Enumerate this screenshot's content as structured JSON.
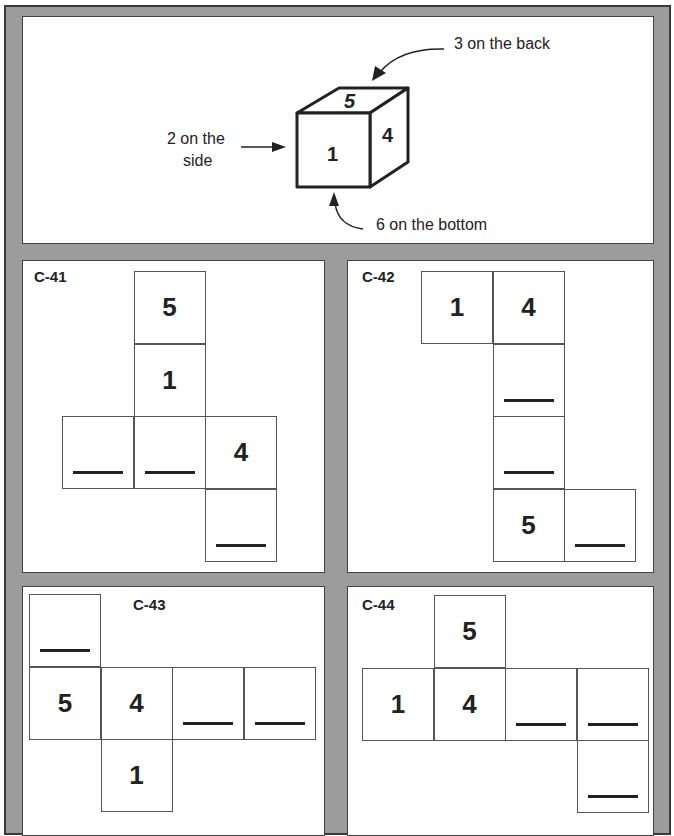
{
  "example": {
    "cube_faces": {
      "front": "1",
      "top": "5",
      "right": "4"
    },
    "labels": {
      "back": "3 on the back",
      "side_line1": "2 on the",
      "side_line2": "side",
      "bottom": "6 on the bottom"
    }
  },
  "problems": [
    {
      "id": "C-41",
      "cells": [
        {
          "col": 1,
          "row": 0,
          "value": "5"
        },
        {
          "col": 1,
          "row": 1,
          "value": "1"
        },
        {
          "col": 0,
          "row": 2,
          "value": ""
        },
        {
          "col": 1,
          "row": 2,
          "value": ""
        },
        {
          "col": 2,
          "row": 2,
          "value": "4"
        },
        {
          "col": 2,
          "row": 3,
          "value": ""
        }
      ]
    },
    {
      "id": "C-42",
      "cells": [
        {
          "col": 0,
          "row": 0,
          "value": "1"
        },
        {
          "col": 1,
          "row": 0,
          "value": "4"
        },
        {
          "col": 1,
          "row": 1,
          "value": ""
        },
        {
          "col": 1,
          "row": 2,
          "value": ""
        },
        {
          "col": 1,
          "row": 3,
          "value": "5"
        },
        {
          "col": 2,
          "row": 3,
          "value": ""
        }
      ]
    },
    {
      "id": "C-43",
      "cells": [
        {
          "col": 0,
          "row": 0,
          "value": ""
        },
        {
          "col": 0,
          "row": 1,
          "value": "5"
        },
        {
          "col": 1,
          "row": 1,
          "value": "4"
        },
        {
          "col": 2,
          "row": 1,
          "value": ""
        },
        {
          "col": 3,
          "row": 1,
          "value": ""
        },
        {
          "col": 1,
          "row": 2,
          "value": "1"
        }
      ]
    },
    {
      "id": "C-44",
      "cells": [
        {
          "col": 1,
          "row": 0,
          "value": "5"
        },
        {
          "col": 0,
          "row": 1,
          "value": "1"
        },
        {
          "col": 1,
          "row": 1,
          "value": "4"
        },
        {
          "col": 2,
          "row": 1,
          "value": ""
        },
        {
          "col": 3,
          "row": 1,
          "value": ""
        },
        {
          "col": 3,
          "row": 2,
          "value": ""
        }
      ]
    }
  ],
  "colors": {
    "gutter": "#9c9c9c",
    "border": "#3a3a3a",
    "ink": "#222222"
  }
}
